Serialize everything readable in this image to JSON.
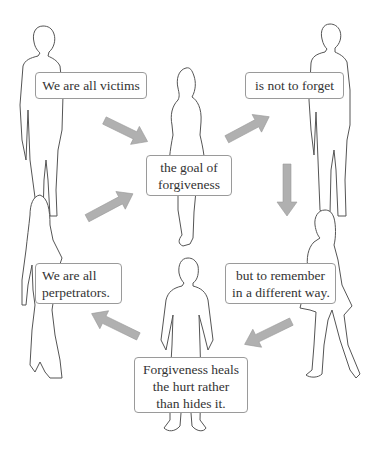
{
  "diagram": {
    "type": "cycle",
    "colors": {
      "arrow": "#b0b0b0",
      "outline": "#555555",
      "box_border": "#9a9a9a",
      "text": "#333333"
    },
    "nodes": [
      {
        "id": "victims",
        "lines": [
          "We are all victims"
        ]
      },
      {
        "id": "goal",
        "lines": [
          "the goal of",
          "forgiveness"
        ]
      },
      {
        "id": "not-forget",
        "lines": [
          "is not to forget"
        ]
      },
      {
        "id": "remember",
        "lines": [
          "but to remember",
          "in a different way."
        ]
      },
      {
        "id": "heals",
        "lines": [
          "Forgiveness heals",
          "the hurt rather",
          "than hides it."
        ]
      },
      {
        "id": "perpetrators",
        "lines": [
          "We are all",
          "perpetrators."
        ]
      }
    ],
    "edges": [
      {
        "from": "victims",
        "to": "goal"
      },
      {
        "from": "goal",
        "to": "not-forget"
      },
      {
        "from": "not-forget",
        "to": "remember"
      },
      {
        "from": "remember",
        "to": "heals"
      },
      {
        "from": "heals",
        "to": "perpetrators"
      },
      {
        "from": "perpetrators",
        "to": "goal"
      }
    ]
  }
}
